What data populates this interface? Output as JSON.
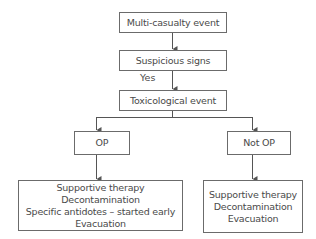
{
  "diagram": {
    "type": "flowchart",
    "nodes": {
      "start": {
        "text": "Multi-casualty event"
      },
      "signs": {
        "text": "Suspicious signs"
      },
      "tox": {
        "text": "Toxicological event"
      },
      "op": {
        "text": "OP"
      },
      "notop": {
        "text": "Not OP"
      },
      "op_actions": {
        "lines": [
          "Supportive therapy",
          "Decontamination",
          "Specific antidotes – started early",
          "Evacuation"
        ]
      },
      "notop_actions": {
        "lines": [
          "Supportive therapy",
          "Decontamination",
          "Evacuation"
        ]
      }
    },
    "edge_labels": {
      "signs_to_tox": "Yes"
    },
    "edges": [
      [
        "start",
        "signs"
      ],
      [
        "signs",
        "tox"
      ],
      [
        "tox",
        "op"
      ],
      [
        "tox",
        "notop"
      ],
      [
        "op",
        "op_actions"
      ],
      [
        "notop",
        "notop_actions"
      ]
    ],
    "colors": {
      "line": "#555555",
      "border": "#6b6b6b",
      "text": "#4a4a4a"
    }
  }
}
